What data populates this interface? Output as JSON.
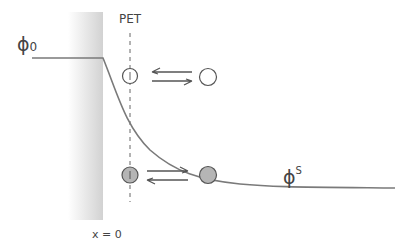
{
  "labels": {
    "pet": "PET",
    "phi0_main": "ϕ",
    "phi0_sub": "0",
    "phis_main": "ϕ",
    "phis_sup": "S",
    "x_origin": "x = 0"
  },
  "colors": {
    "line": "#7a7a7a",
    "filled_circle": "#b5b5b5",
    "stroke": "#555555",
    "electrode_gradient_start": "#ffffff",
    "electrode_gradient_end": "#d6d6d6"
  }
}
